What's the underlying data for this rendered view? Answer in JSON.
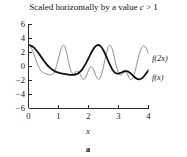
{
  "figure": {
    "title_prefix": "Scaled horizontally by a value ",
    "title_var": "c",
    "title_suffix": " > 1",
    "title_full": "Scaled horizontally by a value c > 1",
    "caption": "a",
    "xlabel": "x",
    "ylabel": ""
  },
  "colors": {
    "base_curve": "#111111",
    "scaled_curve": "#808080",
    "axis": "#2b2b2b",
    "text": "#181818",
    "background": "#ffffff"
  },
  "chart_data": {
    "type": "line",
    "title": "Scaled horizontally by a value c > 1",
    "xlabel": "x",
    "ylabel": "",
    "xlim": [
      0,
      4
    ],
    "ylim": [
      -6,
      6
    ],
    "xticks": [
      0,
      1,
      2,
      3,
      4
    ],
    "yticks": [
      6,
      4,
      2,
      0,
      -2,
      -4,
      -6
    ],
    "xtick_labels": [
      "0",
      "1",
      "2",
      "3",
      "4"
    ],
    "ytick_labels": [
      "6",
      "4",
      "2",
      "0",
      "−2",
      "−4",
      "−6"
    ],
    "grid": false,
    "legend": "inline-right",
    "annotations": [
      {
        "text": "f(2x)",
        "x": 4.05,
        "y": 1.2
      },
      {
        "text": "f(x)",
        "x": 4.05,
        "y": -1.6
      }
    ],
    "series": [
      {
        "name": "f(x)",
        "label": "f(x)",
        "style": "solid-bold",
        "color": "#111111",
        "linewidth": 1.8,
        "formula": "2*cos(2x) + cos(4x)",
        "period": 3.1416,
        "max": 3,
        "min": -2,
        "x": [
          0,
          0.1,
          0.2,
          0.3,
          0.4,
          0.5,
          0.6,
          0.7,
          0.8,
          0.9,
          1.0,
          1.1,
          1.2,
          1.3,
          1.4,
          1.5,
          1.6,
          1.7,
          1.8,
          1.9,
          2.0,
          2.1,
          2.2,
          2.3,
          2.4,
          2.5,
          2.6,
          2.7,
          2.8,
          2.9,
          3.0,
          3.1,
          3.2,
          3.3,
          3.4,
          3.5,
          3.6,
          3.7,
          3.8,
          3.9,
          4.0
        ],
        "values": [
          3.0,
          2.88,
          2.54,
          2.04,
          1.44,
          0.83,
          0.27,
          -0.2,
          -0.55,
          -0.8,
          -0.96,
          -1.07,
          -1.14,
          -1.21,
          -1.27,
          -1.27,
          -1.17,
          -0.9,
          -0.42,
          0.26,
          1.09,
          1.96,
          2.66,
          2.99,
          2.83,
          2.22,
          1.3,
          0.3,
          -0.52,
          -1.0,
          -1.09,
          -0.93,
          -0.75,
          -0.77,
          -1.04,
          -1.45,
          -1.8,
          -1.9,
          -1.7,
          -1.2,
          -0.6
        ]
      },
      {
        "name": "f(2x)",
        "label": "f(2x)",
        "style": "solid-thin",
        "color": "#808080",
        "linewidth": 0.9,
        "formula": "2*cos(4x) + cos(8x)",
        "period": 1.5708,
        "max": 3,
        "min": -2,
        "x": [
          0,
          0.05,
          0.1,
          0.15,
          0.2,
          0.25,
          0.3,
          0.35,
          0.4,
          0.45,
          0.5,
          0.55,
          0.6,
          0.65,
          0.7,
          0.75,
          0.8,
          0.85,
          0.9,
          0.95,
          1.0,
          1.05,
          1.1,
          1.15,
          1.2,
          1.25,
          1.3,
          1.35,
          1.4,
          1.45,
          1.5,
          1.55,
          1.6,
          1.65,
          1.7,
          1.75,
          1.8,
          1.85,
          1.9,
          1.95,
          2.0,
          2.05,
          2.1,
          2.15,
          2.2,
          2.25,
          2.3,
          2.35,
          2.4,
          2.45,
          2.5,
          2.55,
          2.6,
          2.65,
          2.7,
          2.75,
          2.8,
          2.85,
          2.9,
          2.95,
          3.0,
          3.05,
          3.1,
          3.15,
          3.2,
          3.25,
          3.3,
          3.35,
          3.4,
          3.45,
          3.5,
          3.55,
          3.6,
          3.65,
          3.7,
          3.75,
          3.8,
          3.85,
          3.9,
          3.95,
          4.0
        ],
        "values": [
          3.0,
          2.88,
          2.54,
          2.04,
          1.44,
          0.83,
          0.27,
          -0.2,
          -0.55,
          -0.8,
          -0.96,
          -1.07,
          -1.14,
          -1.21,
          -1.27,
          -1.27,
          -1.17,
          -0.9,
          -0.42,
          0.26,
          1.09,
          1.96,
          2.66,
          2.99,
          2.83,
          2.22,
          1.3,
          0.3,
          -0.52,
          -1.0,
          -1.09,
          -0.93,
          -0.75,
          -0.77,
          -1.04,
          -1.45,
          -1.8,
          -1.9,
          -1.7,
          -1.2,
          -0.6,
          -0.2,
          -0.1,
          -0.35,
          -0.85,
          -1.4,
          -1.8,
          -1.9,
          -1.6,
          -0.95,
          -0.05,
          0.95,
          1.9,
          2.6,
          2.95,
          2.85,
          2.3,
          1.45,
          0.5,
          -0.35,
          -1.0,
          -1.3,
          -1.25,
          -1.0,
          -0.8,
          -0.85,
          -1.2,
          -1.65,
          -1.95,
          -1.9,
          -1.5,
          -0.8,
          0.1,
          1.0,
          1.8,
          2.4,
          2.75,
          2.85,
          2.7,
          2.3,
          1.75
        ]
      }
    ]
  }
}
